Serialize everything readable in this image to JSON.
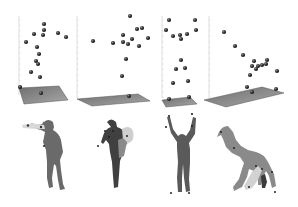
{
  "chart_data": [
    {
      "type": "scatter",
      "title": "",
      "xlabel": "",
      "ylabel": "",
      "grid": false,
      "axis": {
        "x": 19,
        "top": 16,
        "bottom": 95
      },
      "floor": [
        [
          19,
          88
        ],
        [
          59,
          86
        ],
        [
          68,
          100
        ],
        [
          24,
          104
        ]
      ],
      "points": [
        [
          44,
          24
        ],
        [
          44,
          30
        ],
        [
          34,
          34
        ],
        [
          43,
          35
        ],
        [
          58,
          33
        ],
        [
          66,
          37
        ],
        [
          26,
          42
        ],
        [
          37,
          47
        ],
        [
          39,
          54
        ],
        [
          36,
          61
        ],
        [
          38,
          64
        ],
        [
          31,
          72
        ],
        [
          40,
          77
        ],
        [
          20,
          87
        ],
        [
          41,
          93
        ]
      ]
    },
    {
      "type": "scatter",
      "title": "",
      "xlabel": "",
      "ylabel": "",
      "grid": false,
      "axis": {
        "x": 77,
        "top": 16,
        "bottom": 98
      },
      "floor": [
        [
          77,
          99
        ],
        [
          138,
          94
        ],
        [
          150,
          101
        ],
        [
          92,
          106
        ]
      ],
      "points": [
        [
          130,
          16
        ],
        [
          137,
          29
        ],
        [
          142,
          28
        ],
        [
          93,
          41
        ],
        [
          123,
          35
        ],
        [
          113,
          43
        ],
        [
          123,
          42
        ],
        [
          128,
          44
        ],
        [
          132,
          39
        ],
        [
          148,
          38
        ],
        [
          139,
          46
        ],
        [
          126,
          59
        ],
        [
          122,
          76
        ],
        [
          129,
          96
        ]
      ]
    },
    {
      "type": "scatter",
      "title": "",
      "xlabel": "",
      "ylabel": "",
      "grid": false,
      "axis": {
        "x": 162,
        "top": 16,
        "bottom": 98
      },
      "floor": [
        [
          162,
          100
        ],
        [
          190,
          97
        ],
        [
          197,
          104
        ],
        [
          166,
          107
        ]
      ],
      "points": [
        [
          169,
          20
        ],
        [
          195,
          20
        ],
        [
          166,
          30
        ],
        [
          180,
          35
        ],
        [
          196,
          30
        ],
        [
          173,
          36
        ],
        [
          187,
          34
        ],
        [
          181,
          39
        ],
        [
          181,
          60
        ],
        [
          176,
          69
        ],
        [
          185,
          68
        ],
        [
          173,
          83
        ],
        [
          188,
          81
        ],
        [
          169,
          99
        ],
        [
          189,
          97
        ]
      ]
    },
    {
      "type": "scatter",
      "title": "",
      "xlabel": "",
      "ylabel": "",
      "grid": false,
      "axis": {
        "x": 209,
        "top": 16,
        "bottom": 98
      },
      "floor": [
        [
          204,
          100
        ],
        [
          262,
          87
        ],
        [
          284,
          93
        ],
        [
          226,
          107
        ]
      ],
      "points": [
        [
          224,
          32
        ],
        [
          235,
          46
        ],
        [
          243,
          55
        ],
        [
          254,
          61
        ],
        [
          267,
          60
        ],
        [
          252,
          66
        ],
        [
          258,
          66
        ],
        [
          262,
          65
        ],
        [
          266,
          64
        ],
        [
          256,
          69
        ],
        [
          250,
          75
        ],
        [
          277,
          71
        ],
        [
          247,
          87
        ],
        [
          252,
          92
        ],
        [
          276,
          89
        ]
      ]
    }
  ],
  "figures": [
    {
      "label": "pose-1",
      "color": "#6a6a6a"
    },
    {
      "label": "pose-2",
      "color": "#3f3f3f"
    },
    {
      "label": "pose-3",
      "color": "#5a5a5a"
    },
    {
      "label": "pose-4",
      "color": "#8a8a8a"
    }
  ]
}
